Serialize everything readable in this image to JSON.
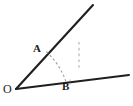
{
  "figure": {
    "type": "geometry-angle-diagram",
    "background_color": "#ffffff",
    "stroke_color": "#1a1a1a",
    "dash_color": "#9a9a9a",
    "width": 133,
    "height": 106,
    "labels": {
      "vertex": "O",
      "point_a": "A",
      "point_b": "B"
    },
    "points": {
      "O": {
        "x": 16,
        "y": 89
      },
      "A": {
        "x": 46,
        "y": 52
      },
      "B": {
        "x": 66,
        "y": 82
      },
      "upper_ray_end": {
        "x": 93,
        "y": 5
      },
      "lower_ray_end": {
        "x": 129,
        "y": 75
      }
    },
    "elements": [
      {
        "name": "upper-ray",
        "kind": "solid-line",
        "from": "O",
        "to": "upper_ray_end"
      },
      {
        "name": "lower-ray",
        "kind": "solid-line",
        "from": "O",
        "to": "lower_ray_end"
      },
      {
        "name": "arc-AB",
        "kind": "dashed-arc",
        "from": "A",
        "to": "B"
      },
      {
        "name": "vertical-tick-marks",
        "kind": "dashed-segment",
        "x": 79,
        "y_start": 42,
        "y_end": 68
      }
    ]
  }
}
